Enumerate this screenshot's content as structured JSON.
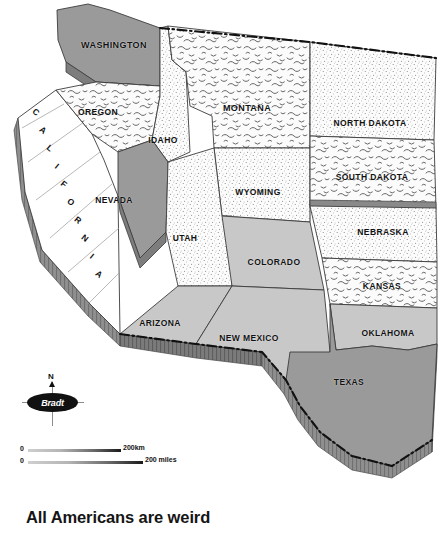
{
  "map": {
    "title_caption": "All Americans are weird",
    "region": "Western United States",
    "colors": {
      "fill_dark_gray": "#9a9a9a",
      "fill_light_gray": "#c8c8c8",
      "fill_white": "#ffffff",
      "texture_squiggle": "#f4f4f4",
      "texture_stipple": "#fafafa",
      "side_shadow_dark": "#6e6e6e",
      "side_shadow_light": "#8d8d8d",
      "outline": "#3a3a3a",
      "border_dashed": "#111111",
      "label_text": "#111111"
    },
    "states": [
      {
        "id": "washington",
        "name": "WASHINGTON",
        "fill": "dark",
        "label_x": 114,
        "label_y": 45
      },
      {
        "id": "oregon",
        "name": "OREGON",
        "fill": "squiggle",
        "label_x": 98,
        "label_y": 112
      },
      {
        "id": "california",
        "name": "CALIFORNIA",
        "fill": "white",
        "label_x": 55,
        "label_y": 215
      },
      {
        "id": "idaho",
        "name": "IDAHO",
        "fill": "stipple",
        "label_x": 163,
        "label_y": 140
      },
      {
        "id": "nevada",
        "name": "NEVADA",
        "fill": "dark",
        "label_x": 114,
        "label_y": 200
      },
      {
        "id": "montana",
        "name": "MONTANA",
        "fill": "squiggle",
        "label_x": 247,
        "label_y": 108
      },
      {
        "id": "wyoming",
        "name": "WYOMING",
        "fill": "stipple",
        "label_x": 258,
        "label_y": 192
      },
      {
        "id": "utah",
        "name": "UTAH",
        "fill": "stipple",
        "label_x": 185,
        "label_y": 238
      },
      {
        "id": "colorado",
        "name": "COLORADO",
        "fill": "light",
        "label_x": 274,
        "label_y": 262
      },
      {
        "id": "arizona",
        "name": "ARIZONA",
        "fill": "light",
        "label_x": 160,
        "label_y": 323
      },
      {
        "id": "new-mexico",
        "name": "NEW MEXICO",
        "fill": "light",
        "label_x": 249,
        "label_y": 338
      },
      {
        "id": "north-dakota",
        "name": "NORTH DAKOTA",
        "fill": "stipple",
        "label_x": 370,
        "label_y": 123
      },
      {
        "id": "south-dakota",
        "name": "SOUTH DAKOTA",
        "fill": "squiggle",
        "label_x": 372,
        "label_y": 177
      },
      {
        "id": "nebraska",
        "name": "NEBRASKA",
        "fill": "stipple",
        "label_x": 383,
        "label_y": 232
      },
      {
        "id": "kansas",
        "name": "KANSAS",
        "fill": "squiggle",
        "label_x": 382,
        "label_y": 286
      },
      {
        "id": "oklahoma",
        "name": "OKLAHOMA",
        "fill": "light",
        "label_x": 388,
        "label_y": 333
      },
      {
        "id": "texas",
        "name": "TEXAS",
        "fill": "dark",
        "label_x": 349,
        "label_y": 382
      }
    ],
    "california_letters": [
      {
        "char": "C",
        "x": 36,
        "y": 112,
        "rot": 38
      },
      {
        "char": "A",
        "x": 43,
        "y": 130,
        "rot": 38
      },
      {
        "char": "L",
        "x": 50,
        "y": 148,
        "rot": 38
      },
      {
        "char": "I",
        "x": 57,
        "y": 166,
        "rot": 38
      },
      {
        "char": "F",
        "x": 64,
        "y": 184,
        "rot": 38
      },
      {
        "char": "O",
        "x": 71,
        "y": 202,
        "rot": 38
      },
      {
        "char": "R",
        "x": 78,
        "y": 220,
        "rot": 38
      },
      {
        "char": "N",
        "x": 85,
        "y": 238,
        "rot": 38
      },
      {
        "char": "I",
        "x": 92,
        "y": 256,
        "rot": 38
      },
      {
        "char": "A",
        "x": 99,
        "y": 274,
        "rot": 38
      }
    ],
    "compass": {
      "north_label": "N",
      "brand": "Bradt"
    },
    "scale": {
      "km": {
        "zero": "0",
        "caption": "200km"
      },
      "miles": {
        "zero": "0",
        "caption": "200 miles"
      }
    }
  }
}
